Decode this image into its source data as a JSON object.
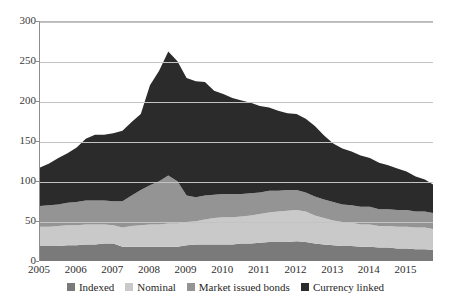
{
  "chart_data": {
    "type": "area",
    "title": "",
    "subtitle": "",
    "xlabel": "",
    "ylabel": "",
    "stacked": true,
    "grid": true,
    "legend_position": "bottom",
    "xlim": [
      2005,
      2015.75
    ],
    "ylim": [
      0,
      300
    ],
    "y_ticks": [
      0,
      50,
      100,
      150,
      200,
      250,
      300
    ],
    "x_ticks": [
      2005,
      2006,
      2007,
      2008,
      2009,
      2010,
      2011,
      2012,
      2013,
      2014,
      2015
    ],
    "x_tick_labels": [
      "2005",
      "2006",
      "2007",
      "2008",
      "2009",
      "2010",
      "2011",
      "2012",
      "2013",
      "2014",
      "2015"
    ],
    "y_tick_labels": [
      "0",
      "50",
      "100",
      "150",
      "200",
      "250",
      "300"
    ],
    "colors": {
      "indexed": "#7a7a7a",
      "nominal": "#c9c9c9",
      "market_issued_bonds": "#949494",
      "currency_linked": "#2b2b2b",
      "gridline": "#c3c3c3",
      "axis": "#8d8d8d",
      "text": "#2e2e2e",
      "background": "#ffffff"
    },
    "x": [
      2005.0,
      2005.25,
      2005.5,
      2005.75,
      2006.0,
      2006.25,
      2006.5,
      2006.75,
      2007.0,
      2007.25,
      2007.5,
      2007.75,
      2008.0,
      2008.25,
      2008.5,
      2008.75,
      2009.0,
      2009.25,
      2009.5,
      2009.75,
      2010.0,
      2010.25,
      2010.5,
      2010.75,
      2011.0,
      2011.25,
      2011.5,
      2011.75,
      2012.0,
      2012.25,
      2012.5,
      2012.75,
      2013.0,
      2013.25,
      2013.5,
      2013.75,
      2014.0,
      2014.25,
      2014.5,
      2014.75,
      2015.0,
      2015.25,
      2015.5,
      2015.75
    ],
    "series": [
      {
        "name": "Indexed",
        "color": "#7a7a7a",
        "values": [
          20,
          20,
          20,
          21,
          21,
          22,
          22,
          23,
          23,
          19,
          19,
          19,
          19,
          19,
          19,
          19,
          21,
          22,
          22,
          22,
          22,
          22,
          23,
          23,
          24,
          25,
          25,
          25,
          26,
          25,
          23,
          22,
          21,
          20,
          20,
          19,
          19,
          18,
          18,
          17,
          17,
          16,
          16,
          15
        ]
      },
      {
        "name": "Nominal",
        "color": "#c9c9c9",
        "values": [
          24,
          24,
          25,
          25,
          25,
          25,
          25,
          24,
          23,
          24,
          26,
          27,
          28,
          28,
          29,
          29,
          29,
          29,
          31,
          33,
          34,
          34,
          34,
          35,
          36,
          37,
          38,
          39,
          39,
          38,
          35,
          33,
          31,
          30,
          29,
          28,
          28,
          27,
          27,
          27,
          27,
          27,
          27,
          26
        ]
      },
      {
        "name": "Market issued bonds",
        "color": "#949494",
        "values": [
          26,
          27,
          27,
          28,
          29,
          30,
          30,
          30,
          30,
          33,
          38,
          44,
          49,
          54,
          60,
          53,
          33,
          30,
          30,
          29,
          29,
          29,
          28,
          28,
          27,
          27,
          26,
          26,
          25,
          24,
          24,
          23,
          23,
          22,
          22,
          22,
          22,
          21,
          21,
          21,
          21,
          20,
          20,
          20
        ]
      },
      {
        "name": "Currency linked",
        "color": "#2b2b2b",
        "values": [
          48,
          52,
          58,
          62,
          68,
          77,
          82,
          82,
          85,
          88,
          92,
          95,
          125,
          138,
          155,
          150,
          147,
          145,
          142,
          130,
          125,
          120,
          117,
          113,
          108,
          104,
          100,
          96,
          95,
          92,
          88,
          80,
          73,
          70,
          67,
          64,
          61,
          58,
          55,
          52,
          48,
          44,
          40,
          35
        ]
      }
    ],
    "totals": [
      118,
      123,
      130,
      136,
      143,
      154,
      159,
      159,
      161,
      164,
      175,
      185,
      221,
      239,
      263,
      251,
      230,
      226,
      225,
      214,
      210,
      205,
      202,
      199,
      195,
      193,
      189,
      186,
      185,
      179,
      170,
      158,
      148,
      142,
      138,
      133,
      130,
      124,
      121,
      117,
      113,
      107,
      103,
      96
    ]
  },
  "legend": {
    "items": [
      {
        "label": "Indexed",
        "color": "#7a7a7a"
      },
      {
        "label": "Nominal",
        "color": "#c9c9c9"
      },
      {
        "label": "Market issued bonds",
        "color": "#949494"
      },
      {
        "label": "Currency linked",
        "color": "#2b2b2b"
      }
    ]
  }
}
